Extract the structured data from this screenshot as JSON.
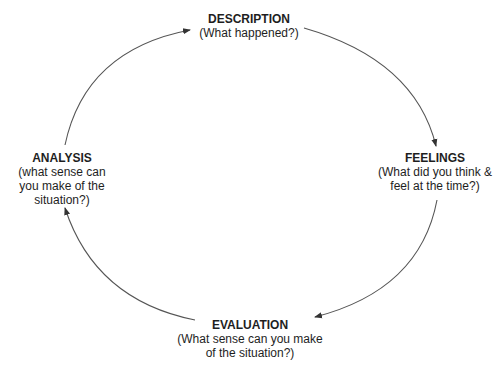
{
  "diagram": {
    "type": "cycle",
    "direction": "clockwise",
    "stroke_color": "#555555",
    "text_color": "#1e1e1e",
    "nodes": {
      "description": {
        "title": "DESCRIPTION",
        "lines": [
          "(What happened?)"
        ]
      },
      "feelings": {
        "title": "FEELINGS",
        "lines": [
          "(What did you think &",
          "feel at the time?)"
        ]
      },
      "evaluation": {
        "title": "EVALUATION",
        "lines": [
          "(What sense can you make",
          "of the situation?)"
        ]
      },
      "analysis": {
        "title": "ANALYSIS",
        "lines": [
          "(what sense can",
          "you make of the",
          "situation?)"
        ]
      }
    },
    "edges": [
      {
        "from": "DESCRIPTION",
        "to": "FEELINGS"
      },
      {
        "from": "FEELINGS",
        "to": "EVALUATION"
      },
      {
        "from": "EVALUATION",
        "to": "ANALYSIS"
      },
      {
        "from": "ANALYSIS",
        "to": "DESCRIPTION"
      }
    ]
  }
}
